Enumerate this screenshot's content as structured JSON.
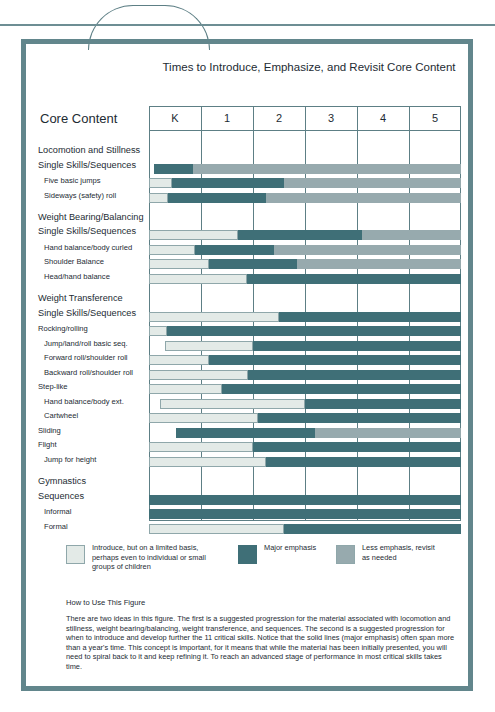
{
  "title": "Times to Introduce, Emphasize, and Revisit Core Content",
  "core_content_heading": "Core Content",
  "colors": {
    "introduce": "#e3eae7",
    "major_emphasis": "#3f6f77",
    "less_emphasis": "#97aaae",
    "frame": "#62868c",
    "grid": "#5d7f85"
  },
  "legend": [
    {
      "swatch": "introduce",
      "label": "Introduce, but on a limited basis, perhaps even to individual or small groups of children"
    },
    {
      "swatch": "major_emphasis",
      "label": "Major emphasis"
    },
    {
      "swatch": "less_emphasis",
      "label": "Less emphasis, revisit as needed"
    }
  ],
  "howto": {
    "heading": "How to Use This Figure",
    "body": "There are two ideas in this figure. The first is a suggested progression for the material associated with locomotion and stillness, weight bearing/balancing, weight transference, and sequences. The second is a suggested progression for when to introduce and develop further the 11 critical skills. Notice that the solid lines (major emphasis) often span more than a year's time. This concept is important, for it means that while the material has been initially presented, you will need to spiral back to it and keep refining it. To reach an advanced stage of performance in most critical skills takes time."
  },
  "chart_data": {
    "type": "bar",
    "title": "Times to Introduce, Emphasize, and Revisit Core Content",
    "xlabel": "",
    "ylabel": "Core Content",
    "orientation": "horizontal-stacked",
    "categories": [
      "K",
      "1",
      "2",
      "3",
      "4",
      "5"
    ],
    "xlim": [
      0,
      6
    ],
    "grid": true,
    "legend_position": "below",
    "series": [
      {
        "name": "Introduce, but on a limited basis, perhaps even to individual or small groups of children",
        "key": "introduce",
        "color": "#e3eae7"
      },
      {
        "name": "Major emphasis",
        "key": "major",
        "color": "#3f6f77"
      },
      {
        "name": "Less emphasis, revisit as needed",
        "key": "less",
        "color": "#97aaae"
      }
    ],
    "rows": [
      {
        "label": "Locomotion and Stillness",
        "level": "group",
        "bar": false,
        "gap_before": 0
      },
      {
        "label": "Single Skills/Sequences",
        "level": "group",
        "bar": true,
        "segments": [
          {
            "type": "major",
            "start": 0.1,
            "end": 0.85
          },
          {
            "type": "less",
            "start": 0.85,
            "end": 6.0
          }
        ]
      },
      {
        "label": "Five basic jumps",
        "level": "indent1",
        "bar": true,
        "segments": [
          {
            "type": "intro",
            "start": 0.0,
            "end": 0.45
          },
          {
            "type": "major",
            "start": 0.45,
            "end": 2.6
          },
          {
            "type": "less",
            "start": 2.6,
            "end": 6.0
          }
        ]
      },
      {
        "label": "Sideways (safety) roll",
        "level": "indent1",
        "bar": true,
        "segments": [
          {
            "type": "intro",
            "start": 0.0,
            "end": 0.37
          },
          {
            "type": "major",
            "start": 0.37,
            "end": 2.25
          },
          {
            "type": "less",
            "start": 2.25,
            "end": 6.0
          }
        ]
      },
      {
        "label": "Weight Bearing/Balancing",
        "level": "group",
        "bar": false,
        "gap_before": 1
      },
      {
        "label": "Single Skills/Sequences",
        "level": "group",
        "bar": true,
        "segments": [
          {
            "type": "intro",
            "start": 0.0,
            "end": 1.72
          },
          {
            "type": "major",
            "start": 1.72,
            "end": 4.1
          },
          {
            "type": "less",
            "start": 4.1,
            "end": 6.0
          }
        ]
      },
      {
        "label": "Hand balance/body curled",
        "level": "indent1",
        "bar": true,
        "segments": [
          {
            "type": "intro",
            "start": 0.0,
            "end": 0.88
          },
          {
            "type": "major",
            "start": 0.88,
            "end": 2.4
          },
          {
            "type": "less",
            "start": 2.4,
            "end": 6.0
          }
        ]
      },
      {
        "label": "Shoulder Balance",
        "level": "indent1",
        "bar": true,
        "segments": [
          {
            "type": "intro",
            "start": 0.0,
            "end": 1.15
          },
          {
            "type": "major",
            "start": 1.15,
            "end": 2.85
          },
          {
            "type": "less",
            "start": 2.85,
            "end": 6.0
          }
        ]
      },
      {
        "label": "Head/hand balance",
        "level": "indent1",
        "bar": true,
        "segments": [
          {
            "type": "intro",
            "start": 0.0,
            "end": 1.88
          },
          {
            "type": "major",
            "start": 1.88,
            "end": 6.0
          }
        ]
      },
      {
        "label": "Weight Transference",
        "level": "group",
        "bar": false,
        "gap_before": 1
      },
      {
        "label": "Single Skills/Sequences",
        "level": "group",
        "bar": true,
        "segments": [
          {
            "type": "intro",
            "start": 0.0,
            "end": 2.5
          },
          {
            "type": "major",
            "start": 2.5,
            "end": 6.0
          }
        ]
      },
      {
        "label": "Rocking/rolling",
        "level": "sub",
        "bar": true,
        "segments": [
          {
            "type": "intro",
            "start": 0.0,
            "end": 0.35
          },
          {
            "type": "major",
            "start": 0.35,
            "end": 6.0
          }
        ]
      },
      {
        "label": "Jump/land/roll basic seq.",
        "level": "indent1",
        "bar": true,
        "segments": [
          {
            "type": "intro",
            "start": 0.3,
            "end": 2.0
          },
          {
            "type": "major",
            "start": 2.0,
            "end": 6.0
          }
        ]
      },
      {
        "label": "Forward roll/shoulder roll",
        "level": "indent1",
        "bar": true,
        "segments": [
          {
            "type": "intro",
            "start": 0.0,
            "end": 1.15
          },
          {
            "type": "major",
            "start": 1.15,
            "end": 6.0
          }
        ]
      },
      {
        "label": "Backward roll/shoulder roll",
        "level": "indent1",
        "bar": true,
        "segments": [
          {
            "type": "intro",
            "start": 0.0,
            "end": 1.9
          },
          {
            "type": "major",
            "start": 1.9,
            "end": 6.0
          }
        ]
      },
      {
        "label": "Step-like",
        "level": "sub",
        "bar": true,
        "segments": [
          {
            "type": "intro",
            "start": 0.0,
            "end": 1.4
          },
          {
            "type": "major",
            "start": 1.4,
            "end": 6.0
          }
        ]
      },
      {
        "label": "Hand balance/body ext.",
        "level": "indent1",
        "bar": true,
        "segments": [
          {
            "type": "intro",
            "start": 0.22,
            "end": 3.0
          },
          {
            "type": "major",
            "start": 3.0,
            "end": 6.0
          }
        ]
      },
      {
        "label": "Cartwheel",
        "level": "indent1",
        "bar": true,
        "segments": [
          {
            "type": "intro",
            "start": 0.0,
            "end": 2.1
          },
          {
            "type": "major",
            "start": 2.1,
            "end": 6.0
          }
        ]
      },
      {
        "label": "Sliding",
        "level": "sub",
        "bar": true,
        "segments": [
          {
            "type": "major",
            "start": 0.52,
            "end": 3.2
          },
          {
            "type": "less",
            "start": 3.2,
            "end": 6.0
          }
        ]
      },
      {
        "label": "Flight",
        "level": "sub",
        "bar": true,
        "segments": [
          {
            "type": "intro",
            "start": 0.0,
            "end": 2.0
          },
          {
            "type": "major",
            "start": 2.0,
            "end": 6.0
          }
        ]
      },
      {
        "label": "Jump for height",
        "level": "indent1",
        "bar": true,
        "segments": [
          {
            "type": "intro",
            "start": 0.0,
            "end": 2.25
          },
          {
            "type": "major",
            "start": 2.25,
            "end": 6.0
          }
        ]
      },
      {
        "label": "Gymnastics",
        "level": "group",
        "bar": false,
        "gap_before": 1
      },
      {
        "label": "Sequences",
        "level": "group",
        "bar": true,
        "segments": [
          {
            "type": "major",
            "start": 0.0,
            "end": 6.0
          }
        ]
      },
      {
        "label": "Informal",
        "level": "indent1",
        "bar": true,
        "segments": [
          {
            "type": "major",
            "start": 0.0,
            "end": 6.0
          }
        ]
      },
      {
        "label": "Formal",
        "level": "indent1",
        "bar": true,
        "segments": [
          {
            "type": "intro",
            "start": 0.0,
            "end": 2.6
          },
          {
            "type": "major",
            "start": 2.6,
            "end": 6.0
          }
        ]
      }
    ]
  }
}
